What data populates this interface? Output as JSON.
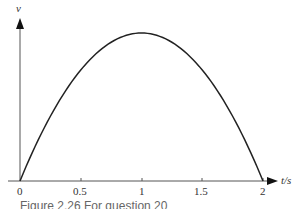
{
  "chart_data": {
    "type": "line",
    "title": "",
    "xlabel": "t/s",
    "ylabel": "v",
    "xlim": [
      0,
      2
    ],
    "x_ticks": [
      0,
      0.5,
      1,
      1.5,
      2
    ],
    "x_tick_labels": [
      "0",
      "0.5",
      "1",
      "1.5",
      "2"
    ],
    "y_ticks": [],
    "grid": false,
    "legend": null,
    "series": [
      {
        "name": "v(t)",
        "shape": "downward parabola, zero at t=0 and t=2, maximum at t=1",
        "x": [
          0,
          0.25,
          0.5,
          0.75,
          1,
          1.25,
          1.5,
          1.75,
          2
        ],
        "values": [
          0,
          0.4375,
          0.75,
          0.9375,
          1,
          0.9375,
          0.75,
          0.4375,
          0
        ]
      }
    ]
  },
  "axes": {
    "y_label": "v",
    "x_label": "t/s",
    "tick_labels": [
      "0",
      "0.5",
      "1",
      "1.5",
      "2"
    ]
  },
  "caption": "Figure 2.26 For question 20"
}
